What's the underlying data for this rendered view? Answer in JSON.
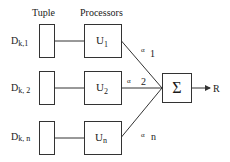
{
  "headers": {
    "tuple": "Tuple",
    "processors": "Processors"
  },
  "rows": [
    {
      "tuple_label_main": "D",
      "tuple_label_sub": "k,1",
      "processor_main": "U",
      "processor_sub": "1",
      "weight_symbol": "α",
      "weight_sub": "1"
    },
    {
      "tuple_label_main": "D",
      "tuple_label_sub": "k, 2",
      "processor_main": "U",
      "processor_sub": "2",
      "weight_symbol": "α",
      "weight_sub": "2"
    },
    {
      "tuple_label_main": "D",
      "tuple_label_sub": "k, n",
      "processor_main": "U",
      "processor_sub": "n",
      "weight_symbol": "α",
      "weight_sub": "n"
    }
  ],
  "aggregator": {
    "symbol": "Σ",
    "output_label": "R"
  }
}
